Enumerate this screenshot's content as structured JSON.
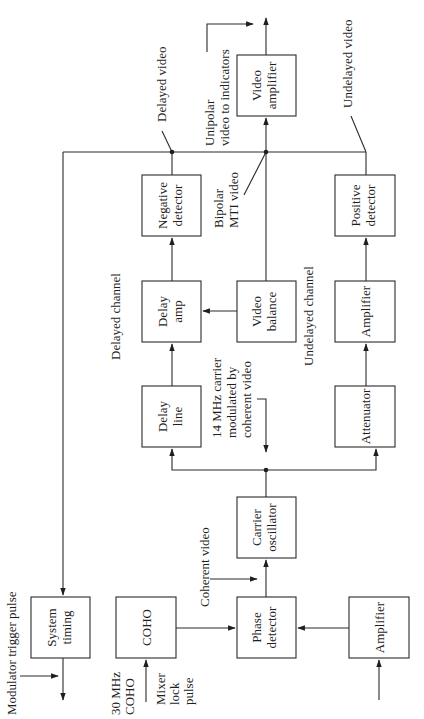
{
  "diagram": {
    "orientation": "rotated -90deg (text reads bottom-to-top)",
    "blocks": {
      "video_amplifier": [
        "Video",
        "amplifier"
      ],
      "negative_detector": [
        "Negative",
        "detector"
      ],
      "positive_detector": [
        "Positive",
        "detector"
      ],
      "delay_amp": [
        "Delay",
        "amp"
      ],
      "video_balance": [
        "Video",
        "balance"
      ],
      "amplifier_undelayed": [
        "Amplifier"
      ],
      "delay_line": [
        "Delay",
        "line"
      ],
      "attenuator": [
        "Attenuator"
      ],
      "carrier_oscillator": [
        "Carrier",
        "oscillator"
      ],
      "system_timing": [
        "System",
        "timing"
      ],
      "coho": [
        "COHO"
      ],
      "phase_detector": [
        "Phase",
        "detector"
      ],
      "amplifier_input": [
        "Amplifier"
      ]
    },
    "annotations": {
      "delayed_video": "Delayed video",
      "unipolar_video": [
        "Unipolar",
        "video to indicators"
      ],
      "undelayed_video": "Undelayed video",
      "bipolar_mti_video": [
        "Bipolar",
        "MTI video"
      ],
      "delayed_channel": "Delayed channel",
      "undelayed_channel": "Undelayed channel",
      "carrier_note": [
        "14 MHz carrier",
        "modulated by",
        "coherent video"
      ],
      "coherent_video": "Coherent video",
      "modulator_trigger_pulse": "Modulator trigger pulse",
      "coho_30mhz": [
        "30 MHz",
        "COHO"
      ],
      "mixer_lock_pulse": [
        "Mixer",
        "lock",
        "pulse"
      ]
    },
    "colors": {
      "line": "#2a2a2a",
      "text": "#1e1e1e",
      "background": "#ffffff"
    }
  }
}
